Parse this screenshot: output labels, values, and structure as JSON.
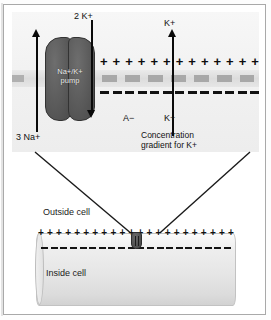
{
  "figure": {
    "width": 271,
    "height": 320
  },
  "inset": {
    "pump": {
      "label_line1": "Na+/K+",
      "label_line2": "pump",
      "name": "sodium-potassium-pump"
    },
    "ion_in_label": "3 Na+",
    "ion_out_label": "2 K+",
    "anion_label": "A−",
    "potassium_top_label": "K+",
    "potassium_bottom_label": "K+",
    "gradient_caption_line1": "Concentration",
    "gradient_caption_line2": "gradient for K+",
    "plus_count": 13,
    "neg_dash_count": 13,
    "bilayer_block_count": 7,
    "charge_symbol_plus": "+",
    "colors": {
      "pump_fill": "#5a5a5a",
      "bilayer": "#a8a8a8",
      "arrow": "#0a0a0a",
      "panel_background": "#f2f2f2"
    }
  },
  "cell": {
    "outside_label": "Outside cell",
    "inside_label": "Inside cell",
    "plus_count": 22,
    "neg_dash_count": 20,
    "charge_symbol_plus": "+",
    "colors": {
      "tube_fill": "#e6e6e6",
      "outline": "#c2c2c2"
    }
  },
  "leaders": {
    "left_line": "magnification-leader-left",
    "right_line": "magnification-leader-right"
  }
}
